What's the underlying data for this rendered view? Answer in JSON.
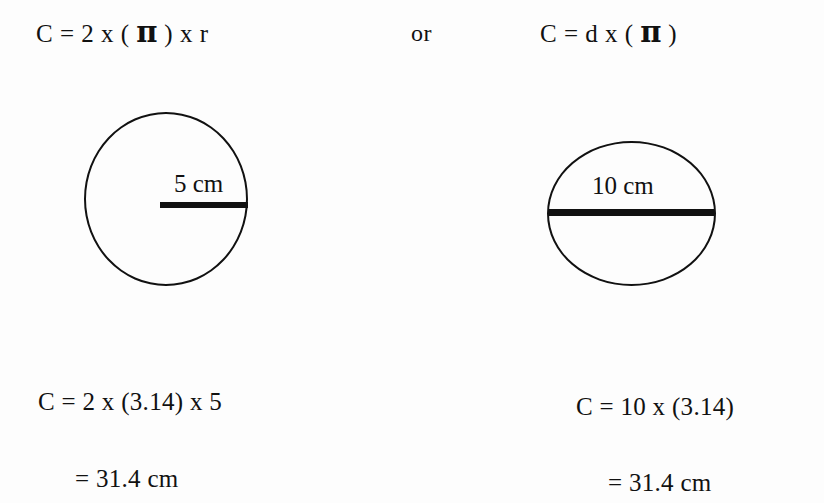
{
  "page": {
    "background_color": "#fdfdfd",
    "ink_color": "#111111",
    "topic": "Circumference of a circle"
  },
  "formulas": {
    "left": {
      "prefix": "C = 2 x ( ",
      "pi": "π",
      "suffix": " ) x r"
    },
    "conjunction": "or",
    "right": {
      "prefix": "C = d x ( ",
      "pi": "π",
      "suffix": " )"
    }
  },
  "figures": {
    "left": {
      "shape": "circle",
      "measure_type": "radius",
      "label": "5 cm",
      "value": 5,
      "unit": "cm"
    },
    "right": {
      "shape": "circle",
      "measure_type": "diameter",
      "label": "10 cm",
      "value": 10,
      "unit": "cm"
    }
  },
  "solutions": {
    "left": {
      "line1": "C = 2 x (3.14) x 5",
      "line2": "= 31.4 cm"
    },
    "right": {
      "line1": "C = 10 x (3.14)",
      "line2": "= 31.4 cm"
    }
  }
}
